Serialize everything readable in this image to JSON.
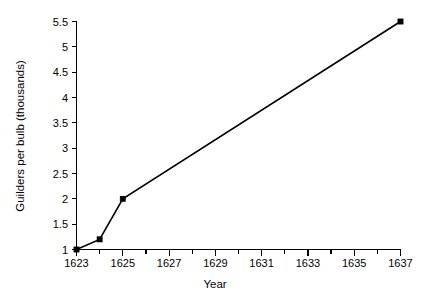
{
  "chart_data": {
    "type": "line",
    "title": "",
    "subtitle": "",
    "xlabel": "Year",
    "ylabel": "Guilders per bulb (thousands)",
    "xlim": [
      1623,
      1637
    ],
    "ylim": [
      1,
      5.5
    ],
    "grid": false,
    "legend": false,
    "legend_position": "none",
    "x": [
      1623,
      1624,
      1625,
      1637
    ],
    "values": [
      1.0,
      1.2,
      2.0,
      5.5
    ],
    "series": [
      {
        "name": "Guilders per bulb (thousands)",
        "x": [
          1623,
          1624,
          1625,
          1637
        ],
        "values": [
          1.0,
          1.2,
          2.0,
          5.5
        ],
        "color": "#000000",
        "marker": "square",
        "line_style": "solid"
      }
    ],
    "x_ticks_major": [
      1623,
      1625,
      1627,
      1629,
      1631,
      1633,
      1635,
      1637
    ],
    "x_tick_labels": [
      "1623",
      "1625",
      "1627",
      "1629",
      "1631",
      "1633",
      "1635",
      "1637"
    ],
    "x_ticks_minor": [
      1624,
      1626,
      1628,
      1630,
      1632,
      1634,
      1636
    ],
    "y_ticks": [
      1,
      1.5,
      2,
      2.5,
      3,
      3.5,
      4,
      4.5,
      5,
      5.5
    ],
    "y_tick_labels": [
      "1",
      "1.5",
      "2",
      "2.5",
      "3",
      "3.5",
      "4",
      "4.5",
      "5",
      "5.5"
    ],
    "annotations": [],
    "colors": {
      "background": "#ffffff",
      "axis": "#000000",
      "series": "#000000",
      "text": "#000000"
    }
  }
}
